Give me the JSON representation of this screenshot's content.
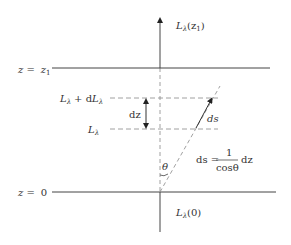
{
  "diagram": {
    "labels": {
      "top_radiance": "L",
      "top_radiance_sub": "λ",
      "top_radiance_arg": "(z",
      "top_radiance_arg_sub": "1",
      "top_radiance_close": ")",
      "z1_level_prefix": "z =",
      "z1_level_value": "z",
      "z1_level_value_sub": "1",
      "z0_level_prefix": "z =",
      "z0_level_value": "0",
      "upper_layer_L": "L",
      "upper_layer_sub": "λ",
      "upper_layer_plus": "+ d",
      "upper_layer_dL": "L",
      "upper_layer_dL_sub": "λ",
      "lower_layer_L": "L",
      "lower_layer_sub": "λ",
      "dz": "dz",
      "ds": "ds",
      "theta": "θ",
      "formula_lhs": "ds =",
      "formula_num": "1",
      "formula_den": "cosθ",
      "formula_rhs": "dz",
      "bottom_radiance": "L",
      "bottom_radiance_sub": "λ",
      "bottom_radiance_arg": "(0)"
    },
    "colors": {
      "line": "#333333",
      "dashed": "#888888",
      "text": "#333333"
    }
  }
}
